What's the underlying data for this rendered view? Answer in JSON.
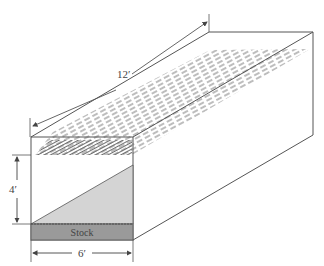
{
  "diagram": {
    "labels": {
      "length": "12′",
      "height": "4′",
      "width": "6′",
      "stock": "Stock"
    },
    "colors": {
      "line": "#555555",
      "stock_fill": "#9a9a9a",
      "wedge_fill": "#d4d4d4",
      "hatch": "#7a7a7a"
    }
  }
}
